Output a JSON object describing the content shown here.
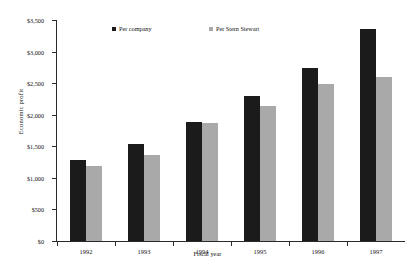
{
  "chart_data": {
    "type": "bar",
    "title": "",
    "xlabel": "Fiscal year",
    "ylabel": "Economic profit",
    "categories": [
      "1992",
      "1993",
      "1994",
      "1995",
      "1996",
      "1997"
    ],
    "series": [
      {
        "name": "Per company",
        "color": "#1b1b1b",
        "values": [
          1290,
          1530,
          1880,
          2290,
          2735,
          3350
        ]
      },
      {
        "name": "Per Stern Stewart",
        "color": "#a9a9a9",
        "values": [
          1195,
          1370,
          1875,
          2145,
          2480,
          2600
        ]
      }
    ],
    "ylim": [
      0,
      3500
    ],
    "ytick_values": [
      0,
      500,
      1000,
      1500,
      2000,
      2500,
      3000,
      3500
    ],
    "ytick_labels": [
      "$0",
      "$500",
      "$1,000",
      "$1,500",
      "$2,000",
      "$2,500",
      "$3,000",
      "$3,500"
    ],
    "grid": false,
    "legend_position": "top-center",
    "annotations": []
  },
  "legend": {
    "items": [
      {
        "label": "Per company",
        "color": "#1b1b1b"
      },
      {
        "label": "Per Stern Stewart",
        "color": "#a9a9a9"
      }
    ]
  },
  "axes": {
    "y_title": "Economic profit",
    "x_title": "Fiscal year"
  }
}
